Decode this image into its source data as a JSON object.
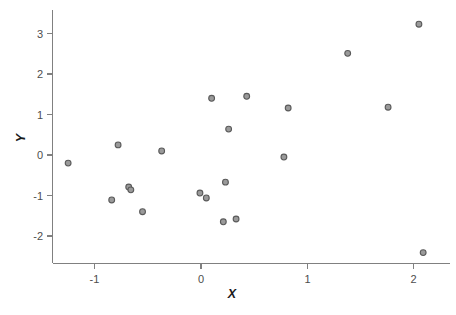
{
  "chart_data": {
    "type": "scatter",
    "title": "",
    "subtitle": "",
    "xlabel": "X",
    "ylabel": "Y",
    "xlim": [
      -1.4,
      2.25
    ],
    "ylim": [
      -2.65,
      3.45
    ],
    "xticks": [
      -1,
      0,
      1,
      2
    ],
    "xtick_labels": [
      "-1",
      "0",
      "1",
      "2"
    ],
    "yticks": [
      -2,
      -1,
      0,
      1,
      2,
      3
    ],
    "ytick_labels": [
      "-2",
      "-1",
      "0",
      "1",
      "2",
      "3"
    ],
    "grid": false,
    "legend": null,
    "legend_position": "none",
    "marker": "circle-open",
    "marker_color": "#9a9a9a",
    "marker_edge_color": "#5a5a5a",
    "axis_color": "#808080",
    "n_points": 21,
    "points": [
      {
        "x": -1.25,
        "y": -0.2
      },
      {
        "x": -0.84,
        "y": -1.11
      },
      {
        "x": -0.78,
        "y": 0.25
      },
      {
        "x": -0.68,
        "y": -0.79
      },
      {
        "x": -0.66,
        "y": -0.86
      },
      {
        "x": -0.55,
        "y": -1.4
      },
      {
        "x": -0.37,
        "y": 0.1
      },
      {
        "x": -0.01,
        "y": -0.94
      },
      {
        "x": 0.05,
        "y": -1.06
      },
      {
        "x": 0.1,
        "y": 1.4
      },
      {
        "x": 0.21,
        "y": -1.65
      },
      {
        "x": 0.23,
        "y": -0.67
      },
      {
        "x": 0.26,
        "y": 0.64
      },
      {
        "x": 0.33,
        "y": -1.58
      },
      {
        "x": 0.43,
        "y": 1.45
      },
      {
        "x": 0.78,
        "y": -0.05
      },
      {
        "x": 0.82,
        "y": 1.16
      },
      {
        "x": 1.38,
        "y": 2.51
      },
      {
        "x": 1.76,
        "y": 1.18
      },
      {
        "x": 2.05,
        "y": 3.23
      },
      {
        "x": 2.09,
        "y": -2.41
      }
    ],
    "x_values": [
      -1.25,
      -0.84,
      -0.78,
      -0.68,
      -0.66,
      -0.55,
      -0.37,
      -0.01,
      0.05,
      0.1,
      0.21,
      0.23,
      0.26,
      0.33,
      0.43,
      0.78,
      0.82,
      1.38,
      1.76,
      2.05,
      2.09
    ],
    "y_values": [
      -0.2,
      -1.11,
      0.25,
      -0.79,
      -0.86,
      -1.4,
      0.1,
      -0.94,
      -1.06,
      1.4,
      -1.65,
      -0.67,
      0.64,
      -1.58,
      1.45,
      -0.05,
      1.16,
      2.51,
      1.18,
      3.23,
      -2.41
    ]
  }
}
